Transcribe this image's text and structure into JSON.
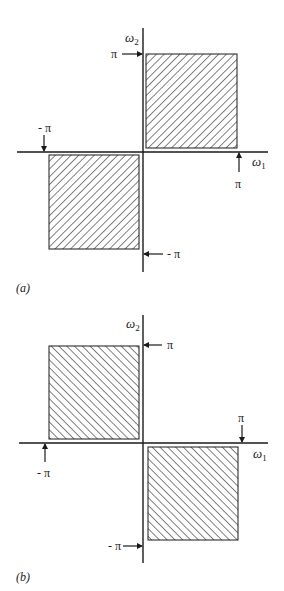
{
  "figure": {
    "panels": [
      {
        "id": "a",
        "caption": "(a)",
        "axes": {
          "horizontal_label": "ω",
          "horizontal_sub": "1",
          "vertical_label": "ω",
          "vertical_sub": "2"
        },
        "markers": {
          "top_pi": "π",
          "left_neg_pi": "- π",
          "right_pi": "π",
          "bottom_neg_pi": "- π"
        },
        "shaded_regions": [
          "first quadrant [0,π]×[0,π]",
          "third quadrant [-π,0]×[-π,0]"
        ],
        "hatch_direction": "forward-slash (/)"
      },
      {
        "id": "b",
        "caption": "(b)",
        "axes": {
          "horizontal_label": "ω",
          "horizontal_sub": "1",
          "vertical_label": "ω",
          "vertical_sub": "2"
        },
        "markers": {
          "top_pi": "π",
          "left_neg_pi": "- π",
          "right_pi": "π",
          "bottom_neg_pi": "- π"
        },
        "shaded_regions": [
          "second quadrant [-π,0]×[0,π]",
          "fourth quadrant [0,π]×[-π,0]"
        ],
        "hatch_direction": "back-slash (\\)"
      }
    ],
    "colors": {
      "ink": "#1a1a1a",
      "background": "#ffffff"
    }
  }
}
